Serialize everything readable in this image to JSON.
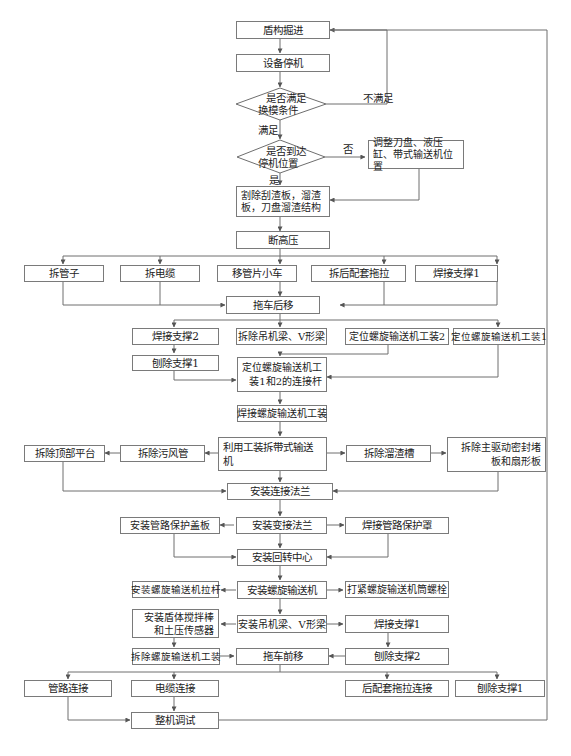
{
  "flowchart": {
    "nodes": {
      "n1": "盾构掘进",
      "n2": "设备停机",
      "d1": "是否满足换模条件",
      "d1_line1": "是否满足",
      "d1_line2": "换模条件",
      "d2": "是否到达停机位置",
      "d2_line1": "是否到达",
      "d2_line2": "停机位置",
      "adjust": "调整刀盘、液压缸、带式输送机位置",
      "cut": "割除刮渣板，溜渣板，刀盘溜渣结构",
      "n_hv": "断高压",
      "r1_a": "拆管子",
      "r1_b": "拆电缆",
      "r1_c": "移管片小车",
      "r1_d": "拆后配套拖拉",
      "r1_e": "焊接支撑1",
      "trailer_back": "拖车后移",
      "weld2": "焊接支撑2",
      "remove_beam": "拆除吊机梁、V形梁",
      "pos_tool2": "定位螺旋输送机工装2",
      "pos_tool1": "定位螺旋输送机工装1",
      "plane1": "刨除支撑1",
      "pos_rod": "定位螺旋输送机工装1和2的连接杆",
      "weld_tool": "焊接螺旋输送机工装",
      "use_tool": "利用工装拆带式输送机",
      "remove_vent": "拆除污风管",
      "remove_top": "拆除顶部平台",
      "remove_chute": "拆除溜渣槽",
      "remove_seal": "拆除主驱动密封堵板和扇形板",
      "flange": "安装连接法兰",
      "adapt_flange": "安装变接法兰",
      "pipe_cover": "安装管路保护盖板",
      "pipe_shield": "焊接管路保护罩",
      "rot_center": "安装回转中心",
      "screw_install": "安装螺旋输送机",
      "screw_rod": "安装螺旋输送机拉杆",
      "screw_bolt": "打紧螺旋输送机筒螺栓",
      "beam_install": "安装吊机梁、V形梁",
      "agitator": "安装盾体搅拌棒和土压传感器",
      "weld1b": "焊接支撑1",
      "remove_screw_tool": "拆除螺旋输送机工装",
      "trailer_fwd": "拖车前移",
      "plane2": "刨除支撑2",
      "pipe_conn": "管路连接",
      "cable_conn": "电缆连接",
      "trailer_conn": "后配套拖拉连接",
      "plane1b": "刨除支撑1",
      "debug": "整机调试"
    },
    "edge_labels": {
      "not_satisfied": "不满足",
      "satisfied": "满足",
      "no": "否",
      "yes": "是"
    },
    "colors": {
      "line": "#6e6e6e",
      "border": "#7a7a7a",
      "text": "#222222",
      "background": "#ffffff"
    }
  }
}
